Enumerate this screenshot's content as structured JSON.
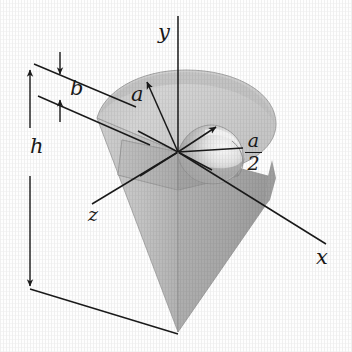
{
  "figure": {
    "kind": "engineering-solid-diagram",
    "background_color": "#fefefe",
    "line_color": "#1a1a1a"
  },
  "colors": {
    "top_face": "#d2d2d2",
    "top_face_dark": "#bdbdbd",
    "cone_body_left": "#c9c9c9",
    "cone_body_right": "#a9a9a9",
    "notch_wall_left": "#b4b4b4",
    "notch_wall_right": "#9d9d9d",
    "notch_floor": "#bcbcbc",
    "cavity_shadow": "#a2a2a2",
    "cavity_highlight": "#f2f2f2",
    "outline": "#8a8a8a"
  },
  "axes": [
    {
      "id": "y",
      "label": "y",
      "direction": "up",
      "label_x": 158,
      "label_y": 22
    },
    {
      "id": "x",
      "label": "x",
      "direction": "down-right",
      "label_x": 316,
      "label_y": 247
    },
    {
      "id": "z",
      "label": "z",
      "direction": "down-left",
      "label_x": 88,
      "label_y": 205
    }
  ],
  "dimensions": [
    {
      "id": "h",
      "label": "h",
      "kind": "linear-vertical",
      "label_x": 30,
      "label_y": 148,
      "describes": "overall height from top face to cone apex"
    },
    {
      "id": "b",
      "label": "b",
      "kind": "linear-vertical",
      "label_x": 70,
      "label_y": 80,
      "describes": "thickness of upper band of the cone"
    }
  ],
  "radii": [
    {
      "id": "a",
      "label": "a",
      "kind": "plain",
      "label_x": 131,
      "label_y": 86,
      "describes": "outer radius of the top face"
    },
    {
      "id": "a_over_2",
      "label_num": "a",
      "label_den": "2",
      "kind": "fraction",
      "label_x": 245,
      "label_y": 133,
      "describes": "radius of the hemispherical cavity"
    }
  ]
}
